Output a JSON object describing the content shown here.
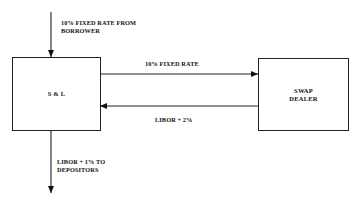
{
  "diagram": {
    "nodes": [
      {
        "id": "sl",
        "label": "S & L"
      },
      {
        "id": "swap_dealer",
        "label_line1": "SWAP",
        "label_line2": "DEALER"
      }
    ],
    "edges": [
      {
        "from": "borrower",
        "to": "sl",
        "label_line1": "10% FIXED RATE FROM",
        "label_line2": "BORROWER"
      },
      {
        "from": "sl",
        "to": "swap_dealer",
        "label": "10% FIXED RATE"
      },
      {
        "from": "swap_dealer",
        "to": "sl",
        "label": "LIBOR + 2%"
      },
      {
        "from": "sl",
        "to": "depositors",
        "label_line1": "LIBOR + 1% TO",
        "label_line2": "DEPOSITORS"
      }
    ]
  }
}
